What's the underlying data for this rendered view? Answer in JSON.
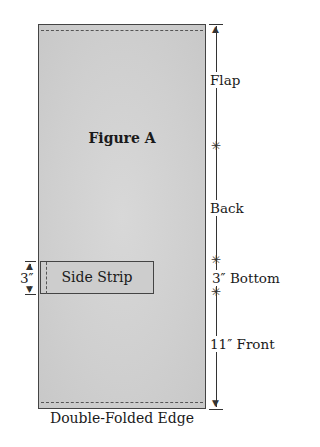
{
  "figure": {
    "title": "Figure A",
    "caption": "Double-Folded Edge"
  },
  "side_strip": {
    "label": "Side Strip",
    "height_label": "3″"
  },
  "sections": [
    {
      "label": "Flap"
    },
    {
      "label": "Back"
    },
    {
      "label": "3″ Bottom"
    },
    {
      "label": "11″ Front"
    }
  ]
}
